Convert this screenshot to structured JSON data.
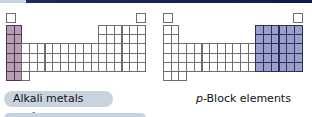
{
  "diagrams": [
    {
      "id": "alkali",
      "highlight": "group-1-2",
      "highlight_color": "#b99cb5"
    },
    {
      "id": "p-block",
      "highlight": "groups-13-18",
      "highlight_color": "#9b9fcc"
    }
  ],
  "buttons": {
    "alkali": {
      "label_main": "Alkali metals (",
      "label_italic": "n",
      "label_s": "s",
      "label_sup": "1",
      "label_end": ")"
    }
  },
  "captions": {
    "pblock": {
      "italic": "p",
      "rest": "-Block elements"
    }
  },
  "colors": {
    "topbar": "#101c46",
    "button_bg": "#c9d3df"
  }
}
